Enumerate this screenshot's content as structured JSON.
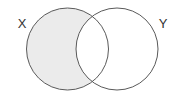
{
  "diagram": {
    "type": "venn",
    "sets": [
      {
        "label": "X",
        "cx": 67.5,
        "cy": 49,
        "r": 41,
        "label_x": 22,
        "label_y": 28
      },
      {
        "label": "Y",
        "cx": 117,
        "cy": 49,
        "r": 41,
        "label_x": 163,
        "label_y": 28
      }
    ],
    "shaded_region": "X \\ Y",
    "colors": {
      "shade": "#ebebeb",
      "stroke": "#5a5a5a",
      "background": "#ffffff"
    }
  }
}
